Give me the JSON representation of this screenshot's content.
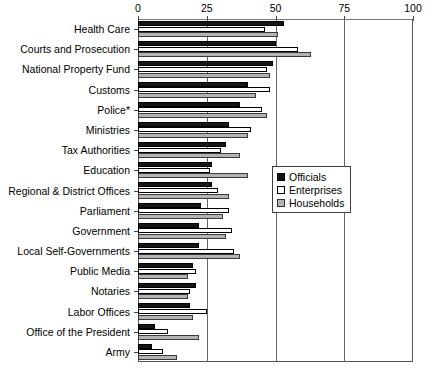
{
  "chart_data": {
    "type": "bar",
    "orientation": "horizontal",
    "title": "",
    "subtitle": "",
    "xlabel": "",
    "ylabel": "",
    "xlim": [
      0,
      100
    ],
    "ticks": [
      "0",
      "25",
      "50",
      "75",
      "100"
    ],
    "tick_values": [
      0,
      25,
      50,
      75,
      100
    ],
    "grid": true,
    "legend_position": "middle-right",
    "footnote": "",
    "categories": [
      "Health Care",
      "Courts and Prosecution",
      "National Property Fund",
      "Customs",
      "Police*",
      "Ministries",
      "Tax Authorities",
      "Education",
      "Regional & District Offices",
      "Parliament",
      "Government",
      "Local Self-Governments",
      "Public Media",
      "Notaries",
      "Labor Offices",
      "Office of the President",
      "Army"
    ],
    "series": [
      {
        "name": "Officials",
        "color": "#161616",
        "values": [
          53,
          50,
          49,
          40,
          37,
          33,
          32,
          27,
          27,
          23,
          22,
          22,
          20,
          21,
          19,
          6,
          5
        ]
      },
      {
        "name": "Enterprises",
        "color": "#ffffff",
        "values": [
          46,
          58,
          47,
          48,
          45,
          41,
          30,
          26,
          29,
          33,
          34,
          35,
          21,
          19,
          25,
          11,
          9
        ]
      },
      {
        "name": "Households",
        "color": "#b3b3b3",
        "values": [
          51,
          63,
          48,
          43,
          47,
          40,
          37,
          40,
          33,
          31,
          32,
          37,
          18,
          18,
          20,
          22,
          14
        ]
      }
    ]
  },
  "legend": {
    "items": [
      {
        "label": "Officials",
        "swatch": "officials"
      },
      {
        "label": "Enterprises",
        "swatch": "enterprises"
      },
      {
        "label": "Households",
        "swatch": "households"
      }
    ]
  }
}
